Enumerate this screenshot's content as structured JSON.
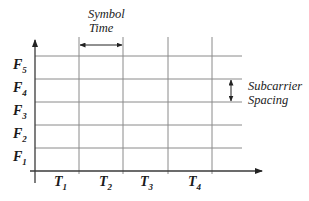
{
  "diagram": {
    "type": "time-frequency grid",
    "y_axis_labels": [
      {
        "main": "F",
        "sub": "5"
      },
      {
        "main": "F",
        "sub": "4"
      },
      {
        "main": "F",
        "sub": "3"
      },
      {
        "main": "F",
        "sub": "2"
      },
      {
        "main": "F",
        "sub": "1"
      }
    ],
    "x_axis_labels": [
      {
        "main": "T",
        "sub": "1"
      },
      {
        "main": "T",
        "sub": "2"
      },
      {
        "main": "T",
        "sub": "3"
      },
      {
        "main": "T",
        "sub": "4"
      }
    ],
    "annotations": {
      "symbol_time": {
        "line1": "Symbol",
        "line2": "Time"
      },
      "subcarrier_spacing": {
        "line1": "Subcarrier",
        "line2": "Spacing"
      }
    },
    "colors": {
      "grid": "#8a8a8a",
      "axis": "#3a3a3a",
      "text": "#1a1a1a",
      "background": "#ffffff"
    }
  }
}
